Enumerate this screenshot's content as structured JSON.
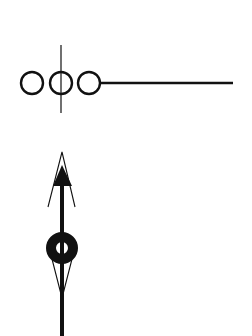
{
  "diagram": {
    "background": "#ffffff",
    "stroke_color": "#111111",
    "symbols": [
      {
        "name": "three-circle-line-symbol",
        "circles": [
          {
            "cx": 32,
            "cy": 83,
            "r": 11
          },
          {
            "cx": 61,
            "cy": 83,
            "r": 11
          },
          {
            "cx": 89,
            "cy": 83,
            "r": 11
          }
        ],
        "tail_line": {
          "x1": 100,
          "y1": 83,
          "x2": 233,
          "y2": 83
        },
        "cross_line": {
          "x1": 61,
          "y1": 45,
          "x2": 61,
          "y2": 113
        }
      },
      {
        "name": "arrow-ring-symbol",
        "shaft": {
          "x1": 62,
          "y1": 180,
          "x2": 62,
          "y2": 336
        },
        "filled_arrowhead": {
          "apex": [
            62,
            165
          ],
          "base_left": [
            53,
            186
          ],
          "base_right": [
            72,
            186
          ]
        },
        "outer_chevron": {
          "apex": [
            62,
            152
          ],
          "left": [
            48,
            207
          ],
          "right": [
            75,
            207
          ]
        },
        "ring": {
          "cx": 62,
          "cy": 248,
          "r_outer": 16,
          "r_inner": 6
        },
        "lower_taper": {
          "left_top": [
            52,
            261
          ],
          "right_top": [
            72,
            261
          ],
          "apex": [
            62,
            298
          ]
        }
      }
    ]
  }
}
